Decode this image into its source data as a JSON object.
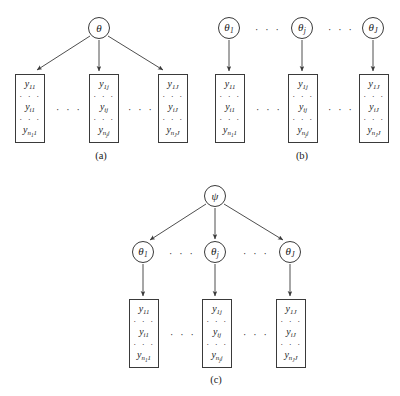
{
  "figure": {
    "stroke_color": "#3a3a3a",
    "background_color": "#ffffff"
  },
  "panels": [
    {
      "id": "a",
      "caption": "(a)",
      "top_node": {
        "symbol": "θ",
        "sub": ""
      },
      "boxes": [
        {
          "rows": [
            {
              "base": "y",
              "sub": "11"
            },
            {
              "base": "y",
              "sub": "i1"
            },
            {
              "base": "y",
              "sub": "n",
              "subsub": "1",
              "tail": "1"
            }
          ]
        },
        {
          "rows": [
            {
              "base": "y",
              "sub": "1j"
            },
            {
              "base": "y",
              "sub": "ij"
            },
            {
              "base": "y",
              "sub": "n",
              "subsub": "j",
              "tail": "j"
            }
          ]
        },
        {
          "rows": [
            {
              "base": "y",
              "sub": "1J"
            },
            {
              "base": "y",
              "sub": "iJ"
            },
            {
              "base": "y",
              "sub": "n",
              "subsub": "J",
              "tail": "J"
            }
          ]
        }
      ],
      "ellipsis": "· · ·"
    },
    {
      "id": "b",
      "caption": "(b)",
      "top_nodes": [
        {
          "symbol": "θ",
          "sub": "1"
        },
        {
          "symbol": "θ",
          "sub": "j"
        },
        {
          "symbol": "θ",
          "sub": "J"
        }
      ],
      "boxes": [
        {
          "rows": [
            {
              "base": "y",
              "sub": "11"
            },
            {
              "base": "y",
              "sub": "i1"
            },
            {
              "base": "y",
              "sub": "n",
              "subsub": "1",
              "tail": "1"
            }
          ]
        },
        {
          "rows": [
            {
              "base": "y",
              "sub": "1j"
            },
            {
              "base": "y",
              "sub": "ij"
            },
            {
              "base": "y",
              "sub": "n",
              "subsub": "j",
              "tail": "j"
            }
          ]
        },
        {
          "rows": [
            {
              "base": "y",
              "sub": "1J"
            },
            {
              "base": "y",
              "sub": "iJ"
            },
            {
              "base": "y",
              "sub": "n",
              "subsub": "J",
              "tail": "J"
            }
          ]
        }
      ],
      "ellipsis": "· · ·"
    },
    {
      "id": "c",
      "caption": "(c)",
      "top_node": {
        "symbol": "ψ",
        "sub": ""
      },
      "mid_nodes": [
        {
          "symbol": "θ",
          "sub": "1"
        },
        {
          "symbol": "θ",
          "sub": "j"
        },
        {
          "symbol": "θ",
          "sub": "J"
        }
      ],
      "boxes": [
        {
          "rows": [
            {
              "base": "y",
              "sub": "11"
            },
            {
              "base": "y",
              "sub": "i1"
            },
            {
              "base": "y",
              "sub": "n",
              "subsub": "1",
              "tail": "1"
            }
          ]
        },
        {
          "rows": [
            {
              "base": "y",
              "sub": "1j"
            },
            {
              "base": "y",
              "sub": "ij"
            },
            {
              "base": "y",
              "sub": "n",
              "subsub": "j",
              "tail": "j"
            }
          ]
        },
        {
          "rows": [
            {
              "base": "y",
              "sub": "1J"
            },
            {
              "base": "y",
              "sub": "iJ"
            },
            {
              "base": "y",
              "sub": "n",
              "subsub": "J",
              "tail": "J"
            }
          ]
        }
      ],
      "ellipsis": "· · ·"
    }
  ],
  "vertical_dots": "· · ·"
}
